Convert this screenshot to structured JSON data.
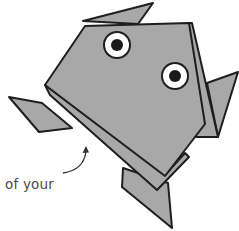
{
  "illustration": {
    "subject": "origami frog",
    "caption": "of your",
    "colors": {
      "paper": "#a8a8a8",
      "outline": "#1e1e1e",
      "eye_white": "#ffffff",
      "pupil": "#1a1a1a",
      "caption_text": "#4a4a4a",
      "background": "#ffffff"
    },
    "eyes": [
      {
        "cx": 117,
        "cy": 45,
        "r": 13
      },
      {
        "cx": 175,
        "cy": 76,
        "r": 13
      }
    ]
  }
}
